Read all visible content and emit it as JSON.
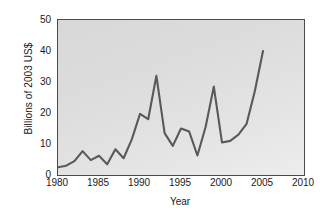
{
  "chart_data": {
    "type": "line",
    "title": "",
    "xlabel": "Year",
    "ylabel": "Billions of 2003 US$",
    "xlim": [
      1980,
      2010
    ],
    "ylim": [
      0,
      50
    ],
    "xticks": [
      1980,
      1985,
      1990,
      1995,
      2000,
      2005,
      2010
    ],
    "yticks": [
      0,
      10,
      20,
      30,
      40,
      50
    ],
    "grid": false,
    "legend": "none",
    "line_color": "#595959",
    "plot_background": "#dedede",
    "series": [
      {
        "name": "Value",
        "x": [
          1980,
          1981,
          1982,
          1983,
          1984,
          1985,
          1986,
          1987,
          1988,
          1989,
          1990,
          1991,
          1992,
          1993,
          1994,
          1995,
          1996,
          1997,
          1998,
          1999,
          2000,
          2001,
          2002,
          2003,
          2004,
          2005
        ],
        "values": [
          2.5,
          3.0,
          4.5,
          7.7,
          4.8,
          6.2,
          3.5,
          8.3,
          5.4,
          11.5,
          19.7,
          18.0,
          32.0,
          13.5,
          9.4,
          15.0,
          14.0,
          6.3,
          15.5,
          28.5,
          10.5,
          11.0,
          13.0,
          16.5,
          27.0,
          40.0
        ]
      }
    ]
  }
}
